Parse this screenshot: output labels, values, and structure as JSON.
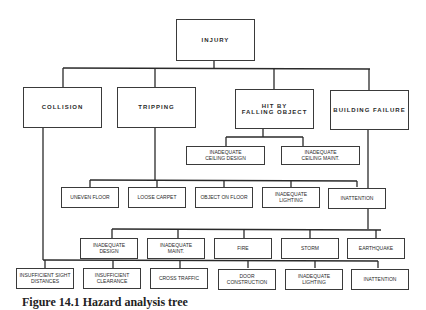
{
  "diagram": {
    "root": {
      "label": "INJURY"
    },
    "categories": [
      {
        "label": "COLLISION"
      },
      {
        "label": "TRIPPING"
      },
      {
        "label": "HIT BY\nFALLING OBJECT"
      },
      {
        "label": "BUILDING FAILURE"
      }
    ],
    "falling_object_causes": [
      {
        "label": "INADEQUATE\nCEILING DESIGN"
      },
      {
        "label": "INADEQUATE\nCEILING MAINT."
      }
    ],
    "tripping_causes": [
      {
        "label": "UNEVEN FLOOR"
      },
      {
        "label": "LOOSE CARPET"
      },
      {
        "label": "OBJECT ON FLOOR"
      },
      {
        "label": "INADEQUATE\nLIGHTING"
      },
      {
        "label": "INATTENTION"
      }
    ],
    "building_failure_causes": [
      {
        "label": "INADEQUATE\nDESIGN"
      },
      {
        "label": "INADEQUATE\nMAINT."
      },
      {
        "label": "FIRE"
      },
      {
        "label": "STORM"
      },
      {
        "label": "EARTHQUAKE"
      }
    ],
    "collision_causes": [
      {
        "label": "INSUFFICIENT SIGHT\nDISTANCES"
      },
      {
        "label": "INSUFFICIENT\nCLEARANCE"
      },
      {
        "label": "CROSS TRAFFIC"
      },
      {
        "label": "DOOR\nCONSTRUCTION"
      },
      {
        "label": "INADEQUATE\nLIGHTING"
      },
      {
        "label": "INATTENTION"
      }
    ]
  },
  "caption": {
    "text": "Figure 14.1   Hazard analysis tree"
  },
  "colors": {
    "line": "#2a2a2a",
    "box_border": "#3a3a3a",
    "text": "#2a2a2a",
    "background": "#ffffff"
  }
}
